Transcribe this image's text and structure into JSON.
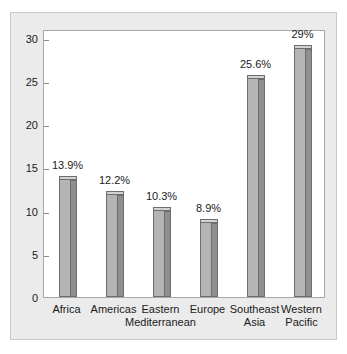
{
  "chart_data": {
    "type": "bar",
    "title": "",
    "subtitle": "",
    "xlabel": "",
    "ylabel": "",
    "ylim": [
      0,
      31
    ],
    "yticks": [
      0,
      5,
      10,
      15,
      20,
      25,
      30
    ],
    "ytick_labels": [
      "0",
      "5",
      "10",
      "15",
      "20",
      "25",
      "30"
    ],
    "grid": false,
    "legend": "none",
    "categories": [
      "Africa",
      "Americas",
      "Eastern Mediterranean",
      "Europe",
      "Southeast Asia",
      "Western Pacific"
    ],
    "category_lines": [
      [
        "Africa",
        ""
      ],
      [
        "Americas",
        ""
      ],
      [
        "Eastern",
        "Mediterranean"
      ],
      [
        "Europe",
        ""
      ],
      [
        "Southeast",
        "Asia"
      ],
      [
        "Western",
        "Pacific"
      ]
    ],
    "values": [
      13.9,
      12.2,
      10.3,
      8.9,
      25.6,
      29
    ],
    "data_labels": [
      "13.9%",
      "12.2%",
      "10.3%",
      "8.9%",
      "25.6%",
      "29%"
    ],
    "series": [
      {
        "name": "Percentage",
        "values": [
          13.9,
          12.2,
          10.3,
          8.9,
          25.6,
          29
        ]
      }
    ],
    "colors": {
      "bar_front": "#b4b4b4",
      "bar_side": "#8f8f8f",
      "bar_top": "#d2d2d2",
      "bar_outline": "#6e6e6e",
      "plot_background": "#ffffff",
      "panel_background": "#ebebeb",
      "panel_border": "#c8c8c8",
      "axis": "#a8a8a8",
      "text": "#1a1a1a"
    }
  }
}
